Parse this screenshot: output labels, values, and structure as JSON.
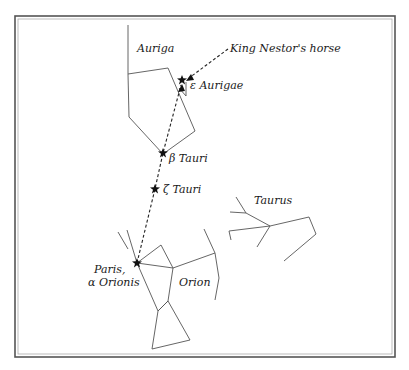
{
  "figure": {
    "labels": {
      "auriga": "Auriga",
      "king_nestor": "King Nestor's horse",
      "epsilon_aurigae": "ε Aurigae",
      "beta_tauri": "β Tauri",
      "zeta_tauri": "ζ Tauri",
      "taurus": "Taurus",
      "paris_line1": "Paris,",
      "paris_line2": "α Orionis",
      "orion": "Orion"
    },
    "stars": [
      {
        "name": "epsilon-aurigae",
        "x": 182,
        "y": 80
      },
      {
        "name": "beta-tauri",
        "x": 163,
        "y": 153
      },
      {
        "name": "zeta-tauri",
        "x": 155,
        "y": 189
      },
      {
        "name": "alpha-orionis",
        "x": 137,
        "y": 263
      }
    ],
    "colors": {
      "line": "#555555",
      "text": "#1a1a1a",
      "star": "#111111",
      "frame": "#555555"
    }
  }
}
